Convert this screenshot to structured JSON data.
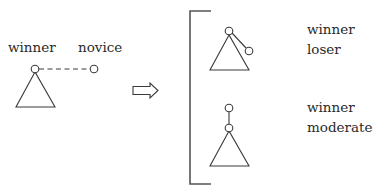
{
  "diagram": {
    "left": {
      "labels": {
        "root": "winner",
        "other": "novice"
      },
      "edge_style": "dashed"
    },
    "arrow": {
      "direction": "right",
      "icon": "hollow-right-arrow"
    },
    "outcomes": [
      {
        "labels": {
          "first": "winner",
          "second": "loser"
        },
        "structure": "loser attached as child of winner root"
      },
      {
        "labels": {
          "first": "winner",
          "second": "moderate"
        },
        "structure": "moderate becomes new root above winner"
      }
    ],
    "colors": {
      "stroke": "#3a3a3a",
      "text": "#2a2a2a",
      "background": "#ffffff"
    }
  }
}
